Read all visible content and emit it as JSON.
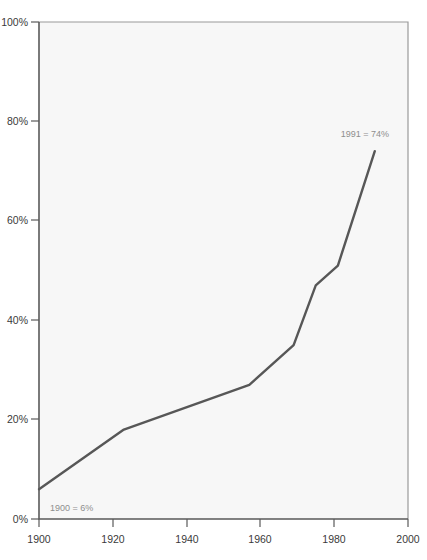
{
  "chart_data": {
    "type": "line",
    "title": "",
    "subtitle": "",
    "xlabel": "",
    "ylabel": "",
    "xlim": [
      1900,
      2000
    ],
    "ylim": [
      0,
      100
    ],
    "grid": false,
    "legend": "none",
    "line_color": "#575757",
    "plot_background": "#f7f7f7",
    "annotation_color": "#8e8e8e",
    "x": [
      1900,
      1923,
      1957,
      1969,
      1975,
      1981,
      1991
    ],
    "values": [
      6,
      18,
      27,
      35,
      47,
      51,
      74
    ],
    "series": [
      {
        "name": "percent",
        "x": [
          1900,
          1923,
          1957,
          1969,
          1975,
          1981,
          1991
        ],
        "values": [
          6,
          18,
          27,
          35,
          47,
          51,
          74
        ]
      }
    ],
    "x_ticks": [
      1900,
      1920,
      1940,
      1960,
      1980,
      2000
    ],
    "x_tick_labels": [
      "1900",
      "1920",
      "1940",
      "1960",
      "1980",
      "2000"
    ],
    "y_ticks": [
      0,
      20,
      40,
      60,
      80,
      100
    ],
    "y_tick_labels": [
      "0%",
      "20%",
      "40%",
      "60%",
      "80%",
      "100%"
    ],
    "annotations": [
      {
        "key": "start",
        "text": "1900 = 6%",
        "x": 1900,
        "y": 6
      },
      {
        "key": "end",
        "text": "1991 = 74%",
        "x": 1991,
        "y": 74
      }
    ]
  }
}
